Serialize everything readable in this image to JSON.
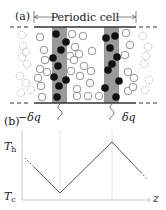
{
  "panel_a": {
    "label": "(a)",
    "cell_label": "Periodic cell",
    "cell_span": {
      "x1": 34,
      "x2": 136,
      "y": 17
    },
    "walls": {
      "top_y": 27,
      "bottom_y": 103,
      "solid_x1": 34,
      "solid_x2": 136,
      "dash_left_x1": 10,
      "dash_right_x2": 160
    },
    "bands": [
      {
        "x": 52,
        "width": 15,
        "color": "#9a9a9a"
      },
      {
        "x": 104,
        "width": 15,
        "color": "#9a9a9a"
      }
    ],
    "colors": {
      "filled_particle": "#111111",
      "open_particle": "#777777",
      "faded_particle": "#aaaaaa",
      "wall": "#333333"
    },
    "filled_particles": [
      [
        56,
        34
      ],
      [
        66,
        42
      ],
      [
        61,
        50
      ],
      [
        53,
        58
      ],
      [
        58,
        66
      ],
      [
        54,
        77
      ],
      [
        66,
        80
      ],
      [
        59,
        86
      ],
      [
        57,
        97
      ],
      [
        106,
        38
      ],
      [
        115,
        36
      ],
      [
        110,
        48
      ],
      [
        117,
        57
      ],
      [
        112,
        64
      ],
      [
        108,
        70
      ],
      [
        119,
        81
      ],
      [
        105,
        88
      ],
      [
        116,
        97
      ]
    ],
    "open_particles": [
      [
        40,
        37
      ],
      [
        44,
        50
      ],
      [
        45,
        60
      ],
      [
        40,
        69
      ],
      [
        47,
        72
      ],
      [
        38,
        78
      ],
      [
        41,
        86
      ],
      [
        42,
        97
      ],
      [
        72,
        34
      ],
      [
        83,
        36
      ],
      [
        75,
        47
      ],
      [
        70,
        56
      ],
      [
        79,
        54
      ],
      [
        74,
        60
      ],
      [
        84,
        66
      ],
      [
        92,
        51
      ],
      [
        91,
        71
      ],
      [
        71,
        71
      ],
      [
        80,
        76
      ],
      [
        90,
        83
      ],
      [
        77,
        89
      ],
      [
        88,
        96
      ],
      [
        77,
        96
      ],
      [
        99,
        96
      ],
      [
        126,
        33
      ],
      [
        130,
        45
      ],
      [
        125,
        55
      ],
      [
        128,
        72
      ],
      [
        134,
        78
      ],
      [
        128,
        91
      ],
      [
        133,
        87
      ]
    ],
    "faded_particles": [
      [
        22,
        35
      ],
      [
        23,
        46
      ],
      [
        26,
        52
      ],
      [
        22,
        57
      ],
      [
        27,
        64
      ],
      [
        20,
        76
      ],
      [
        26,
        83
      ],
      [
        21,
        93
      ],
      [
        31,
        90
      ],
      [
        143,
        36
      ],
      [
        148,
        47
      ],
      [
        146,
        56
      ],
      [
        144,
        64
      ],
      [
        149,
        80
      ],
      [
        145,
        90
      ]
    ],
    "heat_labels": [
      {
        "text": "−δq",
        "x": 18,
        "y": 121,
        "squiggle_x": 60
      },
      {
        "text": "δq",
        "x": 122,
        "y": 121,
        "squiggle_x": 112
      }
    ]
  },
  "panel_b": {
    "label": "(b)",
    "y_labels": {
      "hot": "T",
      "hot_sub": "h",
      "cold": "T",
      "cold_sub": "c"
    },
    "x_label": "z"
  },
  "chart_data": {
    "type": "line",
    "title": "",
    "xlabel": "z",
    "ylabel": "T",
    "y_ticks": [
      "T_c",
      "T_h"
    ],
    "series": [
      {
        "name": "temperature profile",
        "points_px": [
          [
            25,
            158
          ],
          [
            60,
            193
          ],
          [
            112,
            142
          ],
          [
            148,
            180
          ]
        ],
        "dotted_ends": true
      }
    ],
    "vertical_guides_px": [
      60,
      112
    ],
    "axes_px": {
      "x0": 22,
      "y0": 200,
      "x1": 150,
      "y1": 130
    },
    "levels_px": {
      "T_h": 146,
      "T_c": 196
    },
    "line_color": "#555555",
    "guide_color": "#dddddd"
  }
}
